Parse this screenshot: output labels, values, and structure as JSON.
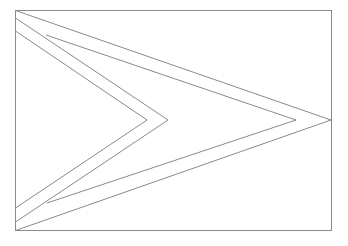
{
  "image": {
    "subject": "flag-outline",
    "background": "#ffffff",
    "stroke": "#8a8a8a",
    "frame": {
      "x": 15,
      "y": 10,
      "width": 317,
      "height": 221
    },
    "outer_triangle": [
      [
        15,
        10
      ],
      [
        331,
        120
      ],
      [
        15,
        231
      ]
    ],
    "white_border_line_top": [
      [
        15,
        18
      ],
      [
        168,
        120
      ]
    ],
    "white_border_line_bottom": [
      [
        168,
        120
      ],
      [
        15,
        222
      ]
    ],
    "chevron_inner_top": [
      [
        15,
        31
      ],
      [
        147,
        120
      ]
    ],
    "chevron_inner_bottom": [
      [
        147,
        120
      ],
      [
        15,
        208
      ]
    ],
    "inner_triangle_top": [
      [
        46,
        35
      ],
      [
        296,
        120
      ]
    ],
    "inner_triangle_bottom": [
      [
        296,
        120
      ],
      [
        47,
        203
      ]
    ]
  }
}
